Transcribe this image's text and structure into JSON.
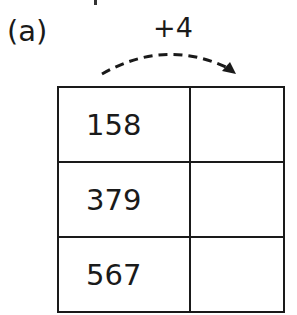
{
  "part_label": "(a)",
  "operation": {
    "label": "+4",
    "arrow": "dashed-curved-arrow-right"
  },
  "table": {
    "columns": [
      "input",
      "output"
    ],
    "rows": [
      {
        "input": "158",
        "output": ""
      },
      {
        "input": "379",
        "output": ""
      },
      {
        "input": "567",
        "output": ""
      }
    ]
  }
}
